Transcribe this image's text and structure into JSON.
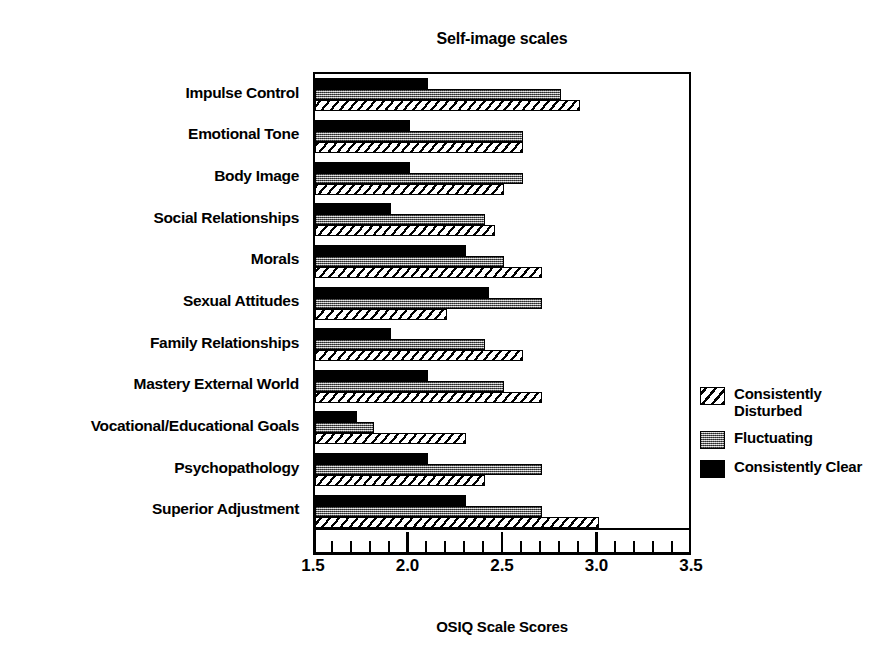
{
  "chart_data": {
    "type": "bar",
    "orientation": "horizontal",
    "title": "Self-image scales",
    "xlabel": "OSIQ Scale Scores",
    "ylabel": "",
    "xlim": [
      1.5,
      3.5
    ],
    "xticks": [
      1.5,
      2.0,
      2.5,
      3.0,
      3.5
    ],
    "xtick_labels": [
      "1.5",
      "2.0",
      "2.5",
      "3.0",
      "3.5"
    ],
    "minor_tick_step": 0.1,
    "grid": false,
    "legend_position": "right",
    "categories": [
      "Impulse Control",
      "Emotional Tone",
      "Body Image",
      "Social Relationships",
      "Morals",
      "Sexual Attitudes",
      "Family Relationships",
      "Mastery External World",
      "Vocational/Educational Goals",
      "Psychopathology",
      "Superior Adjustment"
    ],
    "series": [
      {
        "name": "Consistently Clear",
        "pattern": "solid-black",
        "color": "#000000",
        "values": [
          2.1,
          2.0,
          2.0,
          1.9,
          2.3,
          2.42,
          1.9,
          2.1,
          1.72,
          2.1,
          2.3
        ]
      },
      {
        "name": "Fluctuating",
        "pattern": "gray-dither",
        "color": "#8e8e8e",
        "values": [
          2.8,
          2.6,
          2.6,
          2.4,
          2.5,
          2.7,
          2.4,
          2.5,
          1.81,
          2.7,
          2.7
        ]
      },
      {
        "name": "Consistently Disturbed",
        "pattern": "diagonal-hatch",
        "color": "#ffffff",
        "values": [
          2.9,
          2.6,
          2.5,
          2.45,
          2.7,
          2.2,
          2.6,
          2.7,
          2.3,
          2.4,
          3.0
        ]
      }
    ]
  },
  "legend": {
    "entries": [
      {
        "label": "Consistently Disturbed",
        "swatch": "hatch"
      },
      {
        "label": "Fluctuating",
        "swatch": "gray"
      },
      {
        "label": "Consistently Clear",
        "swatch": "black"
      }
    ]
  }
}
